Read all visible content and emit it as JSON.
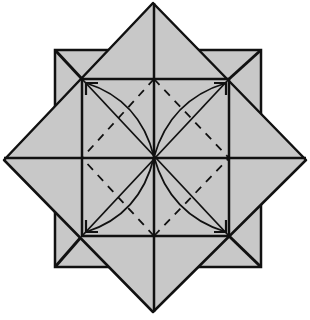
{
  "diagram": {
    "type": "origami-fold-diagram",
    "colors": {
      "paper": "#c8c8c8",
      "line": "#111111",
      "background": "#ffffff"
    },
    "center": [
      154,
      157
    ],
    "outer_square": {
      "x": 55,
      "y": 50,
      "w": 206,
      "h": 217
    },
    "diamond": {
      "top": [
        153,
        3
      ],
      "right": [
        306,
        160
      ],
      "bottom": [
        153,
        312
      ],
      "left": [
        4,
        160
      ]
    },
    "inner_square": {
      "x": 82,
      "y": 79,
      "w": 147,
      "h": 157
    },
    "valley_fold_lines": "dashed diagonals within each inner quadrant",
    "arrows": [
      "center-to-top-left",
      "center-to-top-right",
      "center-to-bottom-left",
      "center-to-bottom-right"
    ]
  }
}
